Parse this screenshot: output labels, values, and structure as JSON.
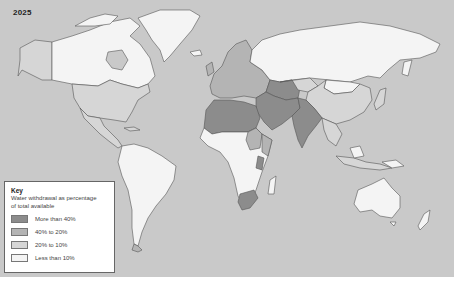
{
  "map": {
    "title": "2025",
    "ocean_color": "#c9c9c9",
    "border_color": "#555555"
  },
  "key": {
    "title": "Key",
    "description": "Water withdrawal as percentage of total available",
    "categories": [
      {
        "label": "More than 40%",
        "color": "#8c8c8c"
      },
      {
        "label": "40% to 20%",
        "color": "#b4b4b4"
      },
      {
        "label": "20% to 10%",
        "color": "#d6d6d6"
      },
      {
        "label": "Less than 10%",
        "color": "#f4f4f4"
      }
    ]
  },
  "regions": [
    {
      "name": "Canada",
      "category": "Less than 10%"
    },
    {
      "name": "Greenland",
      "category": "Less than 10%"
    },
    {
      "name": "Alaska",
      "category": "20% to 10%"
    },
    {
      "name": "United States",
      "category": "20% to 10%"
    },
    {
      "name": "Mexico",
      "category": "20% to 10%"
    },
    {
      "name": "Central America",
      "category": "20% to 10%"
    },
    {
      "name": "South America",
      "category": "Less than 10%"
    },
    {
      "name": "Europe",
      "category": "40% to 20%"
    },
    {
      "name": "Russia",
      "category": "Less than 10%"
    },
    {
      "name": "North Africa",
      "category": "More than 40%"
    },
    {
      "name": "Middle East",
      "category": "More than 40%"
    },
    {
      "name": "Central Asia",
      "category": "More than 40%"
    },
    {
      "name": "India",
      "category": "More than 40%"
    },
    {
      "name": "China",
      "category": "20% to 10%"
    },
    {
      "name": "Mongolia",
      "category": "Less than 10%"
    },
    {
      "name": "Sub-Saharan Africa",
      "category": "Less than 10%"
    },
    {
      "name": "Southern Africa",
      "category": "More than 40%"
    },
    {
      "name": "Southeast Asia",
      "category": "20% to 10%"
    },
    {
      "name": "Australia",
      "category": "Less than 10%"
    },
    {
      "name": "New Zealand",
      "category": "Less than 10%"
    }
  ]
}
